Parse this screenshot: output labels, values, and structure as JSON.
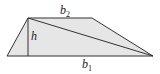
{
  "diagram": {
    "shape": "trapezoid",
    "fill_color": "#e6e6e6",
    "stroke_color": "#333333",
    "vertices": {
      "bottom_left": [
        7,
        56
      ],
      "top_left": [
        28,
        18
      ],
      "top_right": [
        92,
        18
      ],
      "bottom_right": [
        153,
        56
      ]
    },
    "labels": {
      "top_base": {
        "main": "b",
        "sub": "2"
      },
      "bottom_base": {
        "main": "b",
        "sub": "1"
      },
      "height": "h"
    }
  }
}
